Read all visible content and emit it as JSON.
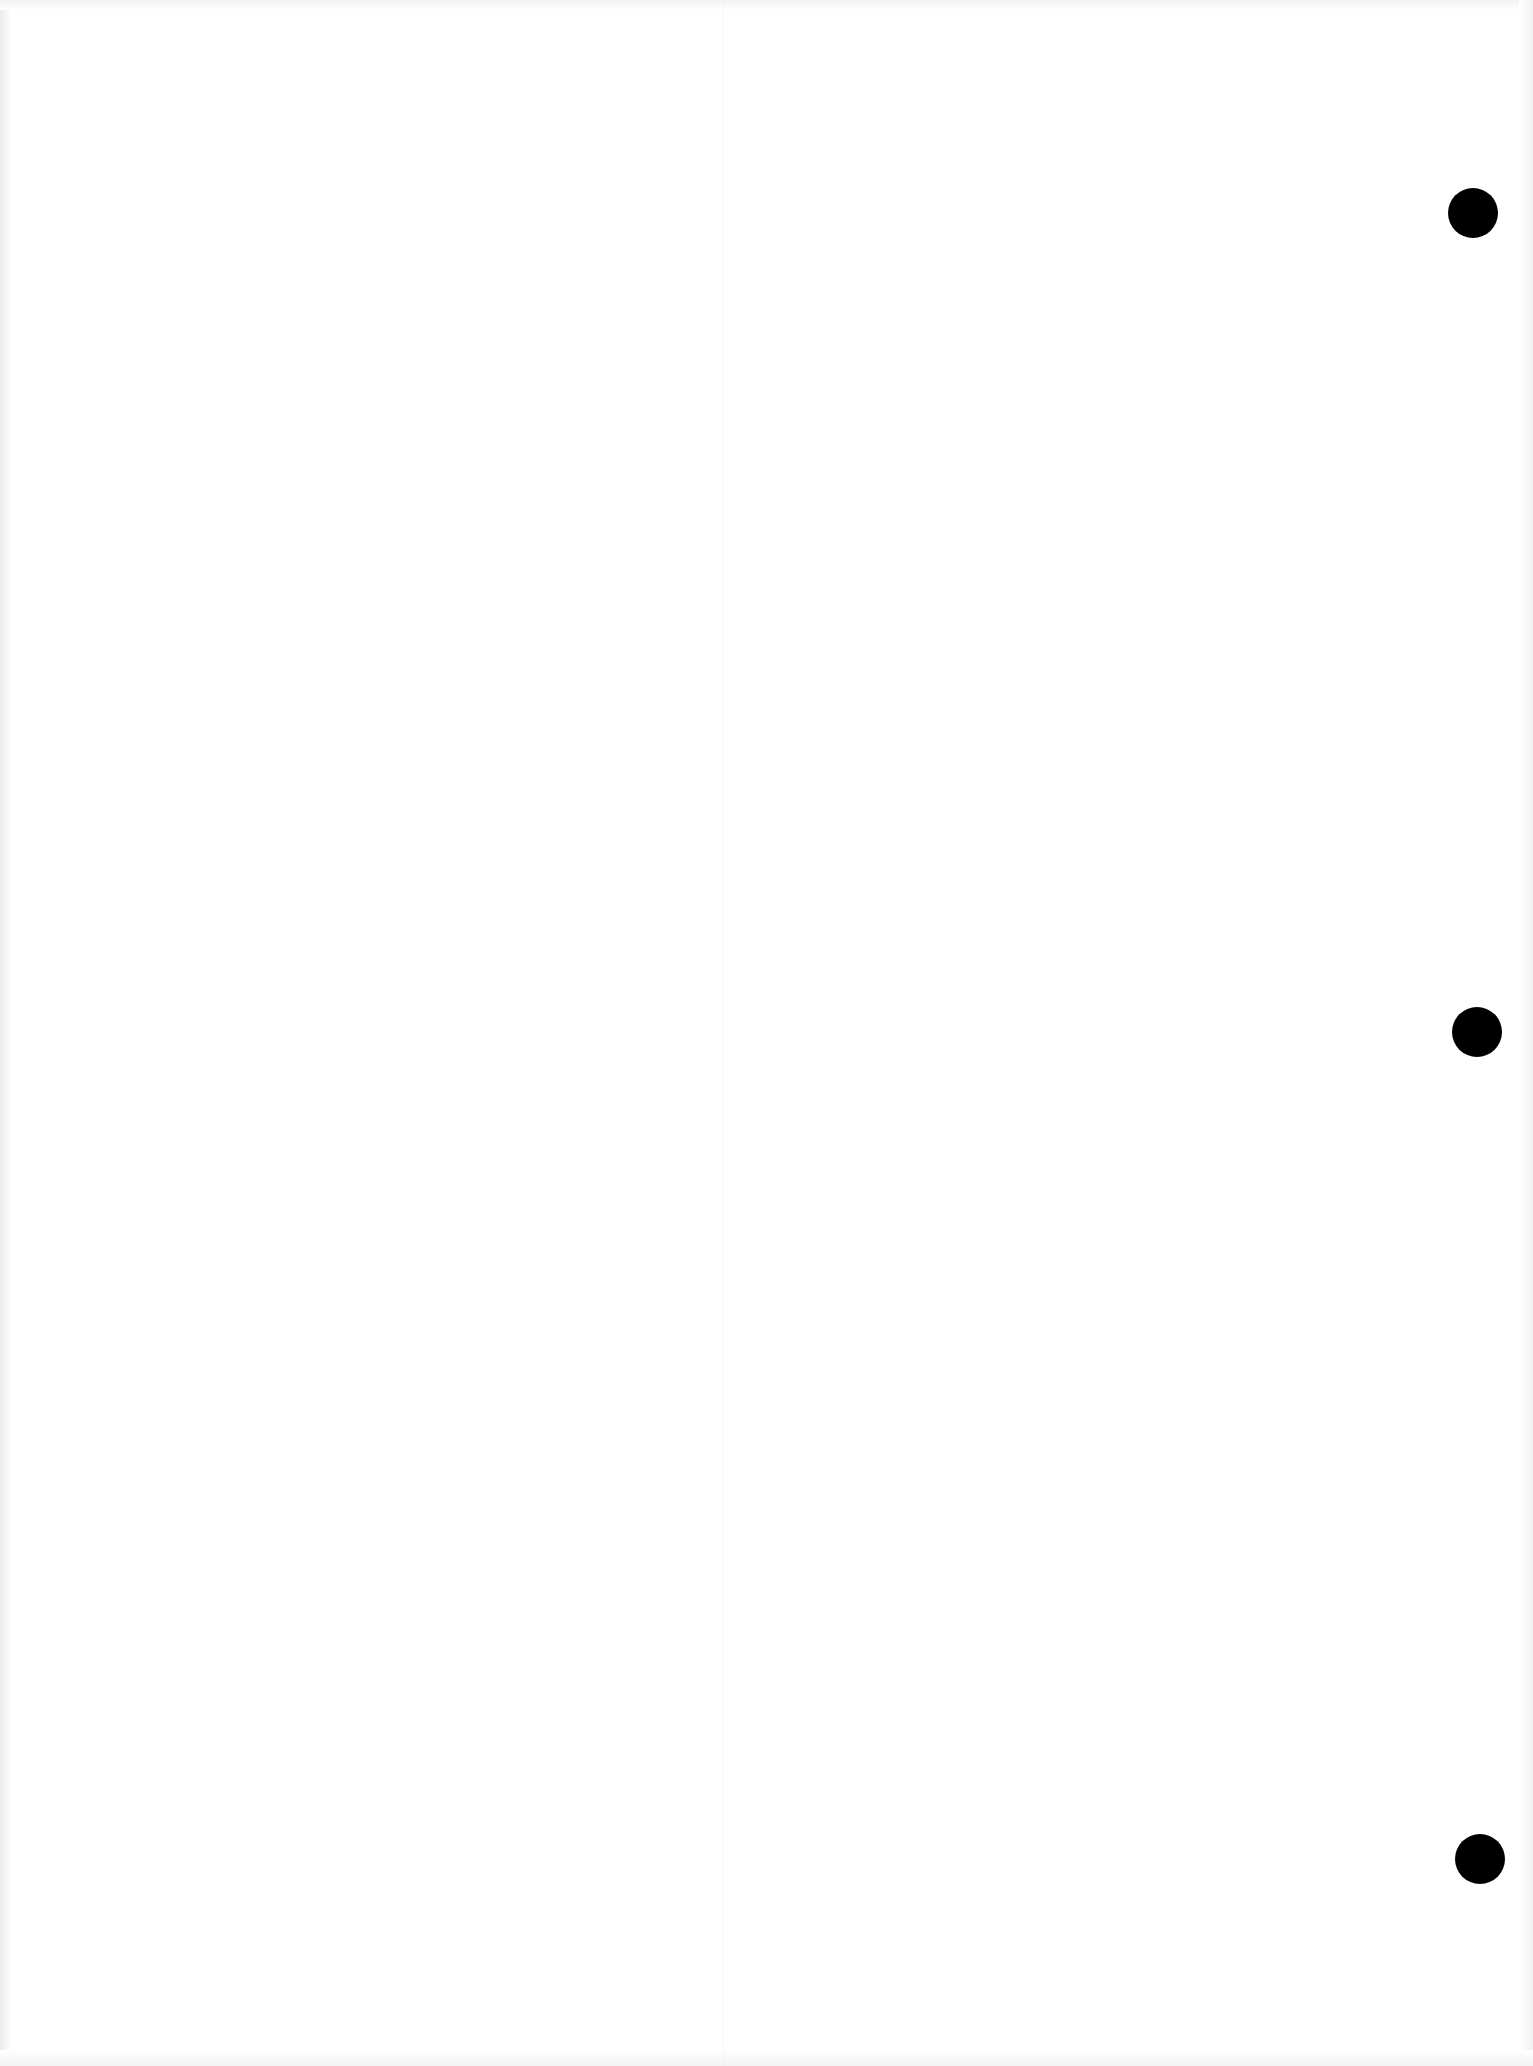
{
  "document": {
    "type": "blank scanned page",
    "background_color": "#ffffff",
    "text_content": ""
  },
  "punch_holes": [
    {
      "cx": 1473,
      "cy": 213,
      "diameter": 50,
      "color": "#000000"
    },
    {
      "cx": 1477,
      "cy": 1032,
      "diameter": 50,
      "color": "#000000"
    },
    {
      "cx": 1480,
      "cy": 1859,
      "diameter": 50,
      "color": "#000000"
    }
  ],
  "fold_line": {
    "x": 723,
    "color": "#ececec"
  }
}
